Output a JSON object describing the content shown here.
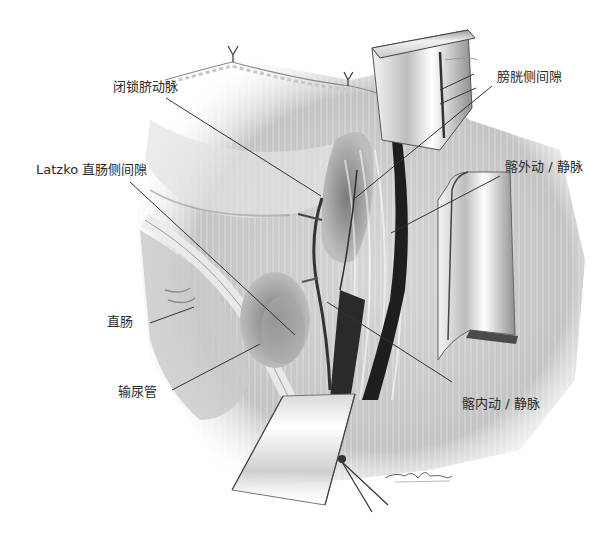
{
  "figure": {
    "type": "surgical-anatomy-illustration",
    "labels": [
      {
        "id": "obliterated-umbilical-artery",
        "text": "闭锁脐动脉",
        "x": 113,
        "y": 80,
        "line": [
          [
            166,
            98
          ],
          [
            321,
            196
          ]
        ]
      },
      {
        "id": "paravesical-space",
        "text": "膀胱侧间隙",
        "x": 497,
        "y": 70,
        "line": [
          [
            492,
            86
          ],
          [
            354,
            199
          ]
        ]
      },
      {
        "id": "external-iliac-vessels",
        "text": "髂外动 / 静脉",
        "x": 505,
        "y": 160,
        "line": [
          [
            500,
            176
          ],
          [
            391,
            233
          ]
        ]
      },
      {
        "id": "latzko-pararectal-space",
        "text": "Latzko 直肠侧间隙",
        "x": 36,
        "y": 163,
        "line": [
          [
            130,
            182
          ],
          [
            295,
            335
          ]
        ]
      },
      {
        "id": "rectum",
        "text": "直肠",
        "x": 107,
        "y": 315,
        "line": [
          [
            150,
            323
          ],
          [
            194,
            307
          ]
        ]
      },
      {
        "id": "ureter",
        "text": "输尿管",
        "x": 118,
        "y": 385,
        "line": [
          [
            172,
            390
          ],
          [
            260,
            344
          ]
        ]
      },
      {
        "id": "internal-iliac-vessels",
        "text": "髂内动 / 静脉",
        "x": 462,
        "y": 397,
        "line": [
          [
            452,
            382
          ],
          [
            327,
            302
          ]
        ]
      }
    ],
    "colors": {
      "label_text": "#2a2a2a",
      "leader_line": "#333333",
      "tissue_light": "#e8e8e8",
      "tissue_mid": "#b8b8b8",
      "vessel_dark": "#1e1e1e",
      "background": "#ffffff"
    }
  }
}
